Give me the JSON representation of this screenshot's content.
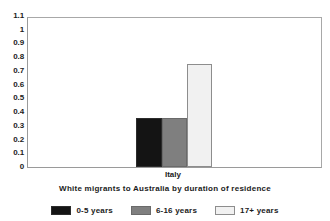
{
  "chart_data": {
    "type": "bar",
    "title": "",
    "xlabel": "White migrants to Australia by duration of residence",
    "ylabel": "",
    "categories": [
      "Italy"
    ],
    "series": [
      {
        "name": "0-5 years",
        "values": [
          0.36
        ],
        "color": "#141414"
      },
      {
        "name": "6-16 years",
        "values": [
          0.36
        ],
        "color": "#7f7f7f"
      },
      {
        "name": "17+ years",
        "values": [
          0.75
        ],
        "color": "#f1f1f1"
      }
    ],
    "ylim": [
      0,
      1.1
    ],
    "ytick_step": 0.1,
    "ytick_labels": [
      "1.1",
      "1",
      "0.9",
      "0.8",
      "0.7",
      "0.6",
      "0.5",
      "0.4",
      "0.3",
      "0.2",
      "0.1",
      "0"
    ],
    "ytick_values": [
      1.1,
      1,
      0.9,
      0.8,
      0.7,
      0.6,
      0.5,
      0.4,
      0.3,
      0.2,
      0.1,
      0
    ],
    "grid": false,
    "legend_position": "bottom",
    "frame": true
  },
  "axis_title": "White migrants to Australia by duration of residence",
  "legend": [
    {
      "label": "0-5 years"
    },
    {
      "label": "6-16 years"
    },
    {
      "label": "17+ years"
    }
  ]
}
